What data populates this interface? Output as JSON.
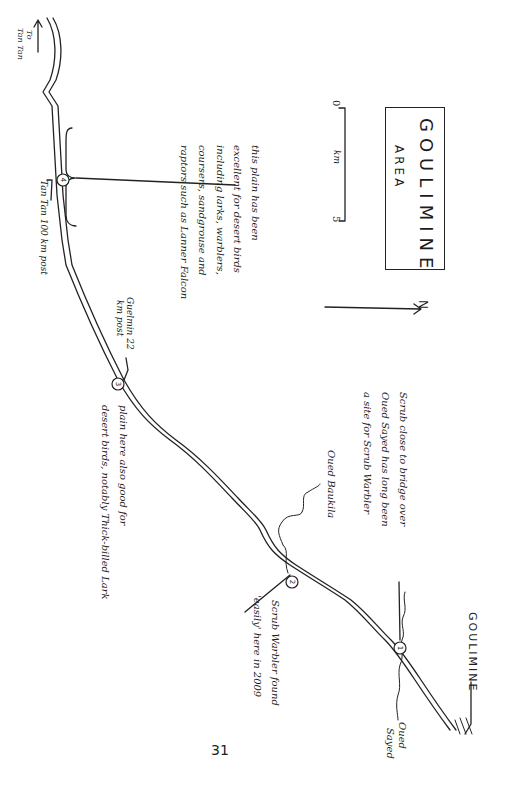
{
  "map": {
    "title": "GOULIMINE",
    "subtitle": "AREA",
    "north_label": "N",
    "scale": {
      "start": "0",
      "unit": "km",
      "end": "5"
    },
    "page_number": "31"
  },
  "places": {
    "tan_tan_direction": "To",
    "tan_tan_direction_2": "Tan Tan",
    "goulimine_town": "GOULIMINE",
    "oued_sayed_1": "Oued",
    "oued_sayed_2": "Sayed",
    "oued_boukila": "Oued Baukila"
  },
  "markers": [
    {
      "id": "1",
      "label": "1"
    },
    {
      "id": "2",
      "label": "2"
    },
    {
      "id": "3",
      "label": "3"
    },
    {
      "id": "4",
      "label": "4"
    }
  ],
  "annotations": {
    "site1": [
      "Scrub close to bridge over",
      "Oued Sayed has long been",
      "a site for Scrub Warbler"
    ],
    "site2": [
      "Scrub Warbler found",
      "'easily' here in 2009"
    ],
    "site3_post": [
      "Guelmin 22",
      "km post"
    ],
    "site3": [
      "plain here also good for",
      "desert birds, notably Thick-billed Lark"
    ],
    "site4_post": "Tan Tan 100 km post",
    "site4": [
      "this plain has been",
      "excellent for desert birds",
      "including larks, warblers,",
      "coursers, sandgrouse and",
      "raptors such as Lanner Falcon"
    ]
  }
}
